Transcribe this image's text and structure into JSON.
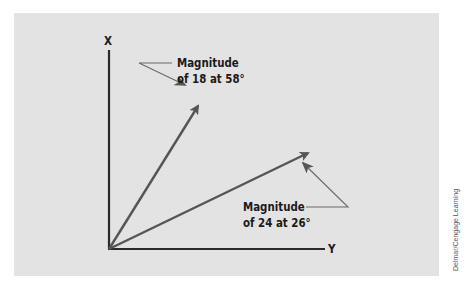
{
  "diagram": {
    "axes": {
      "vertical_label": "X",
      "horizontal_label": "Y"
    },
    "vectors": [
      {
        "name": "vector-18",
        "magnitude": 18,
        "angle_deg": 58,
        "callout_line1": "Magnitude",
        "callout_line2": "of 18 at 58°"
      },
      {
        "name": "vector-24",
        "magnitude": 24,
        "angle_deg": 26,
        "callout_line1": "Magnitude",
        "callout_line2": "of 24 at 26°"
      }
    ],
    "colors": {
      "background": "#e3e3e3",
      "axis": "#2a2a2a",
      "vector": "#555555",
      "callout_line": "#6a6a6a"
    }
  },
  "credit": "Delmar/Cengage Learning"
}
